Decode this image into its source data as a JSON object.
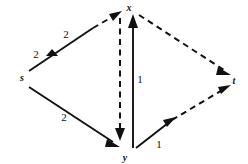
{
  "diagram": {
    "kind": "directed-graph",
    "canvas": {
      "width": 248,
      "height": 164,
      "background": "#ffffff"
    },
    "ink_color": "#111111",
    "nodes": [
      {
        "id": "s",
        "label": "s",
        "x": 22,
        "y": 78
      },
      {
        "id": "x",
        "label": "x",
        "x": 128,
        "y": 12
      },
      {
        "id": "y",
        "label": "y",
        "x": 124,
        "y": 152
      },
      {
        "id": "t",
        "label": "t",
        "x": 232,
        "y": 80
      }
    ],
    "edges": [
      {
        "id": "s-x",
        "from": "s",
        "to": "x",
        "style": "solid-then-dashed",
        "weights": [
          "2",
          "2"
        ],
        "arrowheads": [
          "mid",
          "end"
        ]
      },
      {
        "id": "s-y",
        "from": "s",
        "to": "y",
        "style": "solid",
        "weights": [
          "2"
        ],
        "arrowheads": [
          "end"
        ]
      },
      {
        "id": "x-y",
        "from": "x",
        "to": "y",
        "style": "dashed",
        "weights": [],
        "arrowheads": [
          "end"
        ]
      },
      {
        "id": "y-x",
        "from": "y",
        "to": "x",
        "style": "solid",
        "weights": [
          "1"
        ],
        "arrowheads": [
          "end"
        ]
      },
      {
        "id": "x-t",
        "from": "x",
        "to": "t",
        "style": "dashed",
        "weights": [],
        "arrowheads": [
          "end"
        ]
      },
      {
        "id": "y-t",
        "from": "y",
        "to": "t",
        "style": "solid-then-dashed",
        "weights": [
          "1"
        ],
        "arrowheads": [
          "mid",
          "end"
        ]
      }
    ],
    "labels": {
      "node_s": "s",
      "node_x": "x",
      "node_y": "y",
      "node_t": "t",
      "weight_sx_lower": "2",
      "weight_sx_upper": "2",
      "weight_sy": "2",
      "weight_yx": "1",
      "weight_yt": "1"
    }
  }
}
